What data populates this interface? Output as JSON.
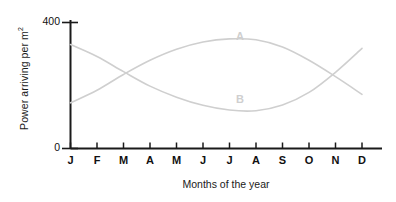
{
  "chart_data": {
    "type": "line",
    "title": "",
    "xlabel": "Months of the year",
    "ylabel": "Power arriving per m",
    "ylabel_superscript": "2",
    "xtick_labels": [
      "J",
      "F",
      "M",
      "A",
      "M",
      "J",
      "J",
      "A",
      "S",
      "O",
      "N",
      "D"
    ],
    "categories": [
      "January",
      "February",
      "March",
      "April",
      "May",
      "June",
      "July",
      "August",
      "September",
      "October",
      "November",
      "December"
    ],
    "ytick_labels": [
      "0",
      "400"
    ],
    "ylim": [
      0,
      400
    ],
    "yticks": [
      0,
      400
    ],
    "grid": false,
    "legend": "inline-labels",
    "series": [
      {
        "name": "A",
        "label": "A",
        "color": "#cfcfcf",
        "values": [
          145,
          185,
          235,
          280,
          315,
          338,
          348,
          345,
          322,
          280,
          228,
          172
        ]
      },
      {
        "name": "B",
        "label": "B",
        "color": "#cfcfcf",
        "values": [
          330,
          292,
          244,
          198,
          163,
          137,
          122,
          120,
          138,
          178,
          242,
          318
        ]
      }
    ]
  },
  "axis": {
    "color": "#1a1a1a"
  }
}
